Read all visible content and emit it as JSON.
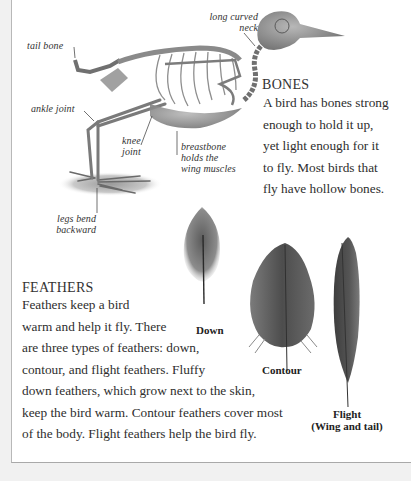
{
  "skeleton": {
    "labels": {
      "tail_bone": "tail bone",
      "long_curved_neck": [
        "long curved",
        "neck"
      ],
      "ankle_joint": "ankle joint",
      "knee_joint": [
        "knee",
        "joint"
      ],
      "breastbone": [
        "breastbone",
        "holds the",
        "wing muscles"
      ],
      "legs_bend": [
        "legs bend",
        "backward"
      ]
    }
  },
  "bones": {
    "heading": "BONES",
    "lines": [
      "A bird has bones strong",
      "enough to hold it up,",
      "yet light enough for it",
      "to fly. Most birds that",
      "fly have hollow bones."
    ]
  },
  "feathers": {
    "heading": "FEATHERS",
    "lines": [
      "Feathers keep a bird",
      "warm and help it fly. There",
      "are three types of feathers: down,",
      "contour, and flight feathers. Fluffy",
      "down feathers, which grow next to the skin,",
      "keep the bird warm. Contour feathers cover most",
      "of the body. Flight feathers help the bird fly."
    ],
    "captions": {
      "down": "Down",
      "contour": "Contour",
      "flight": [
        "Flight",
        "(Wing and tail)"
      ]
    }
  }
}
